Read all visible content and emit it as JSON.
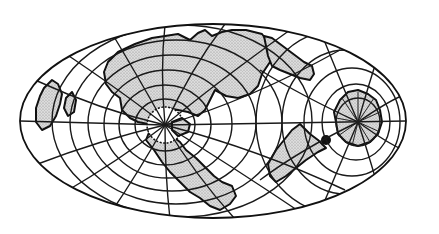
{
  "figure": {
    "type": "oblique world map projection",
    "description": "Elliptical world map with graticule grid and stippled continental landmasses arranged around two projection poles",
    "colors": {
      "background": "#ffffff",
      "ink": "#111111",
      "land_fill": "#d4d4d4",
      "stipple_dot": "#8a8a8a"
    },
    "ellipse": {
      "cx": 213,
      "cy": 121,
      "rx": 193,
      "ry": 97
    },
    "poles": [
      {
        "name": "left-pole",
        "cx": 165,
        "cy": 125,
        "style": "white serrated ice cap"
      },
      {
        "name": "right-pole",
        "cx": 358,
        "cy": 122,
        "style": "stippled radial landmass"
      }
    ],
    "landmasses": [
      "northern central continent",
      "upper-right elongated continent",
      "left-edge landmass",
      "southern peninsula",
      "lower-right triangular continent",
      "right polar landmass",
      "small dark island"
    ]
  }
}
